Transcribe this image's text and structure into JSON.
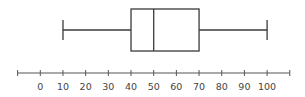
{
  "chart_data": {
    "type": "boxplot",
    "title": "",
    "xlabel": "",
    "ylabel": "",
    "orientation": "horizontal",
    "min": 10,
    "q1": 40,
    "median": 50,
    "q3": 70,
    "max": 100,
    "axis": {
      "range": [
        -10,
        110
      ],
      "ticks": [
        -10,
        0,
        10,
        20,
        30,
        40,
        50,
        60,
        70,
        80,
        90,
        100,
        110
      ],
      "tick_labels": [
        "",
        "0",
        "10",
        "20",
        "30",
        "40",
        "50",
        "60",
        "70",
        "80",
        "90",
        "100",
        ""
      ]
    },
    "grid": false,
    "legend": null
  },
  "colors": {
    "line": "#3a3a3a",
    "axis": "#555555",
    "text": "#444444",
    "background": "#ffffff"
  }
}
